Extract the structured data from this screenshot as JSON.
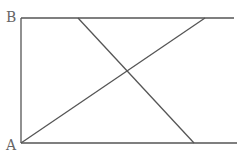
{
  "diagram": {
    "type": "geometry",
    "labels": {
      "A": "A",
      "B": "B"
    },
    "points": {
      "A": [
        21,
        143
      ],
      "B": [
        21,
        18
      ],
      "top_right": [
        234,
        18
      ],
      "bottom_right": [
        237,
        143
      ],
      "top_cross_start": [
        78,
        18
      ],
      "bottom_cross_end": [
        194,
        143
      ],
      "top_diag_end": [
        205,
        18
      ]
    },
    "segments": [
      {
        "name": "top-line",
        "from": "B",
        "to": "top_right"
      },
      {
        "name": "left-line",
        "from": "B",
        "to": "A"
      },
      {
        "name": "bottom-line",
        "from": "A",
        "to": "bottom_right"
      },
      {
        "name": "descending-diagonal",
        "from": "top_cross_start",
        "to": "bottom_cross_end"
      },
      {
        "name": "ascending-diagonal",
        "from": "A",
        "to": "top_diag_end"
      }
    ],
    "colors": {
      "line": "#555555",
      "label": "#666666"
    }
  }
}
